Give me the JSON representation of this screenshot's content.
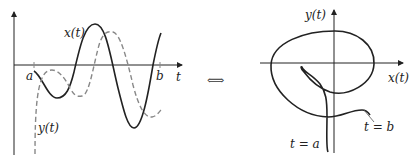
{
  "left_plot": {
    "x_axis_label": "t",
    "curve_x_label": "x(t)",
    "curve_y_label": "y(t)",
    "tick_a": "a",
    "tick_b": "b"
  },
  "equivalence_symbol": "⟺",
  "right_plot": {
    "x_axis_label": "x(t)",
    "y_axis_label": "y(t)",
    "start_label": "t = a",
    "end_label": "t = b"
  },
  "colors": {
    "solid_curve": "#222222",
    "dashed_curve": "#888888",
    "axes": "#222222"
  }
}
